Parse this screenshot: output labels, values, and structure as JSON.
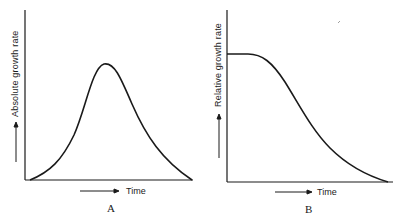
{
  "panels": [
    {
      "id": "A",
      "label": "A",
      "ylabel": "Absolute growth rate",
      "xlabel": "Time",
      "curve": "bell-shaped"
    },
    {
      "id": "B",
      "label": "B",
      "ylabel": "Relative growth rate",
      "xlabel": "Time",
      "curve": "plateau then declining sigmoid"
    }
  ],
  "colors": {
    "line": "#1a1a1a",
    "background": "#ffffff"
  }
}
